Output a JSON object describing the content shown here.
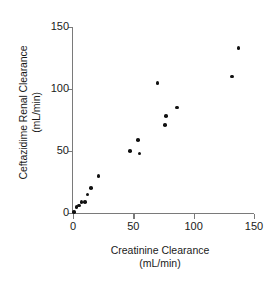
{
  "chart_data": {
    "type": "scatter",
    "title": "",
    "xlabel": "Creatinine Clearance",
    "xlabel_units": "(mL/min)",
    "ylabel": "Ceftazidime Renal Clearance",
    "ylabel_units": "(mL/min)",
    "xlim": [
      0,
      150
    ],
    "ylim": [
      0,
      150
    ],
    "xticks": [
      0,
      50,
      100,
      150
    ],
    "yticks": [
      0,
      50,
      100,
      150
    ],
    "xtick_labels": [
      "0",
      "50",
      "100",
      "150"
    ],
    "ytick_labels": [
      "0",
      "50",
      "100",
      "150"
    ],
    "grid": false,
    "legend": null,
    "marker": "filled-circle",
    "marker_color": "#111111",
    "axis_color": "#7a7a7a",
    "background_color": "#ffffff",
    "points": [
      {
        "x": 1,
        "y": 1
      },
      {
        "x": 3,
        "y": 5
      },
      {
        "x": 5,
        "y": 6
      },
      {
        "x": 7,
        "y": 9
      },
      {
        "x": 10,
        "y": 9
      },
      {
        "x": 12,
        "y": 15
      },
      {
        "x": 15,
        "y": 20
      },
      {
        "x": 21,
        "y": 30
      },
      {
        "x": 47,
        "y": 50
      },
      {
        "x": 54,
        "y": 59
      },
      {
        "x": 55,
        "y": 48
      },
      {
        "x": 70,
        "y": 105
      },
      {
        "x": 76,
        "y": 71
      },
      {
        "x": 77,
        "y": 78
      },
      {
        "x": 86,
        "y": 85
      },
      {
        "x": 132,
        "y": 110
      },
      {
        "x": 137,
        "y": 133
      }
    ]
  }
}
